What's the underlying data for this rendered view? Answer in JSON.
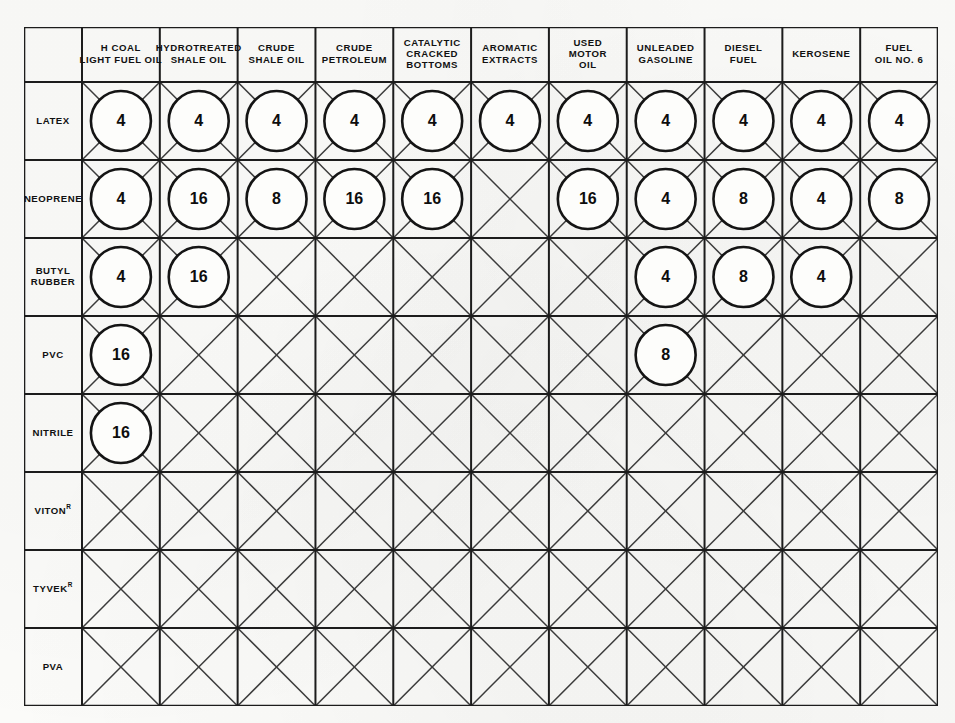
{
  "table": {
    "corner_label": "",
    "column_headers": [
      {
        "id": "h-coal-light-fuel-oil",
        "lines": [
          "H COAL",
          "LIGHT FUEL OIL"
        ]
      },
      {
        "id": "hydrotreated-shale-oil",
        "lines": [
          "HYDROTREATED",
          "SHALE OIL"
        ]
      },
      {
        "id": "crude-shale-oil",
        "lines": [
          "CRUDE",
          "SHALE OIL"
        ]
      },
      {
        "id": "crude-petroleum",
        "lines": [
          "CRUDE",
          "PETROLEUM"
        ]
      },
      {
        "id": "catalytic-cracked-bottoms",
        "lines": [
          "CATALYTIC",
          "CRACKED",
          "BOTTOMS"
        ]
      },
      {
        "id": "aromatic-extracts",
        "lines": [
          "AROMATIC",
          "EXTRACTS"
        ]
      },
      {
        "id": "used-motor-oil",
        "lines": [
          "USED",
          "MOTOR",
          "OIL"
        ]
      },
      {
        "id": "unleaded-gasoline",
        "lines": [
          "UNLEADED",
          "GASOLINE"
        ]
      },
      {
        "id": "diesel-fuel",
        "lines": [
          "DIESEL",
          "FUEL"
        ]
      },
      {
        "id": "kerosene",
        "lines": [
          "KEROSENE"
        ]
      },
      {
        "id": "fuel-oil-no-6",
        "lines": [
          "FUEL",
          "OIL NO. 6"
        ]
      }
    ],
    "row_headers": [
      {
        "id": "latex",
        "lines": [
          "LATEX"
        ],
        "registered": false
      },
      {
        "id": "neoprene",
        "lines": [
          "NEOPRENE"
        ],
        "registered": false
      },
      {
        "id": "butyl-rubber",
        "lines": [
          "BUTYL",
          "RUBBER"
        ],
        "registered": false
      },
      {
        "id": "pvc",
        "lines": [
          "PVC"
        ],
        "registered": false
      },
      {
        "id": "nitrile",
        "lines": [
          "NITRILE"
        ],
        "registered": false
      },
      {
        "id": "viton",
        "lines": [
          "VITON"
        ],
        "registered": true
      },
      {
        "id": "tyvek",
        "lines": [
          "TYVEK"
        ],
        "registered": true
      },
      {
        "id": "pva",
        "lines": [
          "PVA"
        ],
        "registered": false
      }
    ],
    "cells": [
      [
        "4",
        "4",
        "4",
        "4",
        "4",
        "4",
        "4",
        "4",
        "4",
        "4",
        "4"
      ],
      [
        "4",
        "16",
        "8",
        "16",
        "16",
        "",
        "16",
        "4",
        "8",
        "4",
        "8"
      ],
      [
        "4",
        "16",
        "",
        "",
        "",
        "",
        "",
        "4",
        "8",
        "4",
        ""
      ],
      [
        "16",
        "",
        "",
        "",
        "",
        "",
        "",
        "8",
        "",
        "",
        ""
      ],
      [
        "16",
        "",
        "",
        "",
        "",
        "",
        "",
        "",
        "",
        "",
        ""
      ],
      [
        "",
        "",
        "",
        "",
        "",
        "",
        "",
        "",
        "",
        "",
        ""
      ],
      [
        "",
        "",
        "",
        "",
        "",
        "",
        "",
        "",
        "",
        "",
        ""
      ],
      [
        "",
        "",
        "",
        "",
        "",
        "",
        "",
        "",
        "",
        "",
        ""
      ]
    ],
    "empty_marker": "x-cross",
    "registered_symbol": "R"
  },
  "colors": {
    "page_background": "#fbfbf9",
    "grid_line": "#1c1c1c",
    "diagonal_line": "#3b3b3b",
    "circle_fill": "#fdfdfb",
    "circle_stroke": "#141414",
    "text": "#111111"
  },
  "geometry": {
    "table_left": 24,
    "table_top": 27,
    "table_width": 914,
    "table_height": 679,
    "label_col_width": 58,
    "header_row_height": 55,
    "data_col_width": 77.8,
    "data_row_height": 78,
    "circle_radius": 30
  }
}
